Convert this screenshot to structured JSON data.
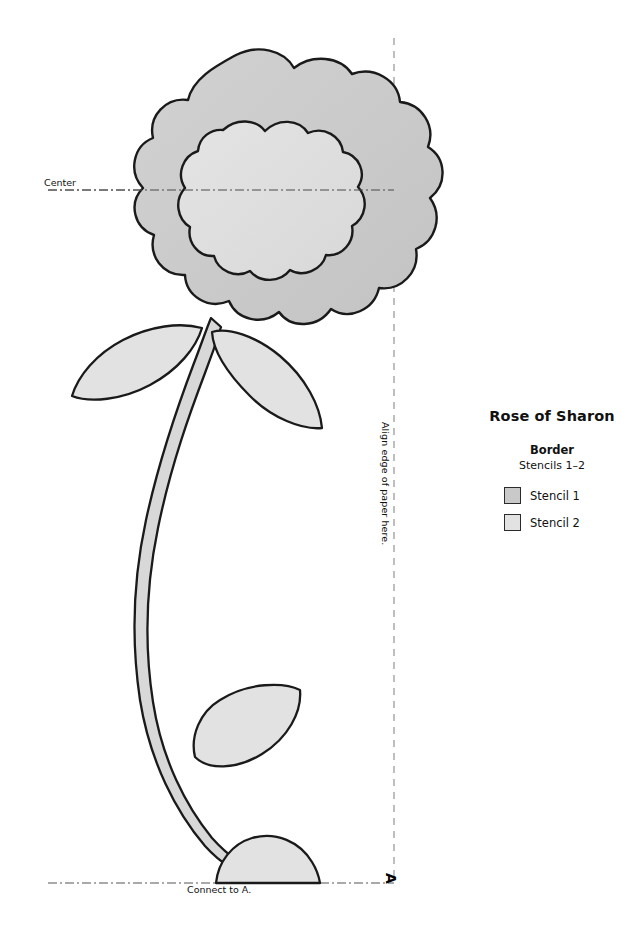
{
  "page": {
    "background": "#ffffff",
    "width": 638,
    "height": 942
  },
  "artwork": {
    "name": "rose-of-sharon-stencil-pattern",
    "outline_color": "#1a1a1a",
    "stencil1_fill": "#c9c9c9",
    "stencil2_fill": "#dedede",
    "guide_line_color": "#555555",
    "dashed_line_color": "#8a8a8a",
    "elements": [
      "flower-outer-scallop",
      "flower-inner-scallop",
      "stem",
      "leaf-upper-left",
      "leaf-upper-right",
      "leaf-lower",
      "bud-bottom"
    ]
  },
  "guides": {
    "center_label": "Center",
    "connect_label": "Connect to A.",
    "align_label": "Align edge of paper here.",
    "corner_marker": "A"
  },
  "legend": {
    "title": "Rose of Sharon",
    "subtitle": "Border",
    "stencil_range": "Stencils 1–2",
    "items": [
      {
        "label": "Stencil 1",
        "color": "#c9c9c9"
      },
      {
        "label": "Stencil 2",
        "color": "#e2e2e2"
      }
    ]
  }
}
